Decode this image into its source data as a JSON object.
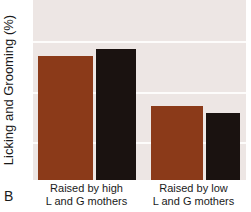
{
  "panel": {
    "label": "B"
  },
  "chart_data": {
    "type": "bar",
    "title": "",
    "subtitle": "",
    "xlabel": "",
    "ylabel": "Licking and Grooming (%)",
    "grid": true,
    "legend": "none",
    "ylim": [
      0,
      100
    ],
    "y_gridline_values": [
      77,
      49,
      21
    ],
    "categories": [
      "Raised by high L and G mothers",
      "Raised by low L and G mothers"
    ],
    "category_lines": [
      {
        "line1": "Raised by high",
        "line2": "L and G mothers"
      },
      {
        "line1": "Raised by low",
        "line2": "L and G mothers"
      }
    ],
    "bars": [
      {
        "name": "high-group-bar-1",
        "category": "Raised by high L and G mothers",
        "value": 69,
        "color": "#8b3a19",
        "color_name": "brown"
      },
      {
        "name": "high-group-bar-2",
        "category": "Raised by high L and G mothers",
        "value": 73,
        "color": "#1a1210",
        "color_name": "black"
      },
      {
        "name": "low-group-bar-1",
        "category": "Raised by low L and G mothers",
        "value": 41,
        "color": "#8b3a19",
        "color_name": "brown"
      },
      {
        "name": "low-group-bar-2",
        "category": "Raised by low L and G mothers",
        "value": 37,
        "color": "#1a1210",
        "color_name": "black"
      }
    ],
    "series": [
      {
        "name": "brown",
        "color": "#8b3a19",
        "values": [
          69,
          41
        ]
      },
      {
        "name": "black",
        "color": "#1a1210",
        "values": [
          73,
          37
        ]
      }
    ],
    "plot_background_color": "#ede6e4",
    "gridline_color": "#fdfcfb"
  }
}
